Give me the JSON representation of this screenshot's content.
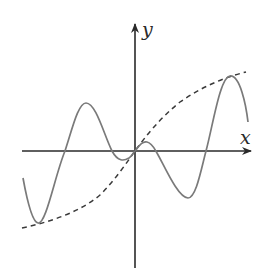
{
  "figure": {
    "type": "function-graph",
    "axes": {
      "x_label": "x",
      "y_label": "y",
      "origin_px": [
        135,
        151
      ],
      "x_axis_px": {
        "from": 22,
        "to": 251
      },
      "y_axis_px": {
        "from": 268,
        "to": 24
      },
      "ticks": "none"
    },
    "colors": {
      "axes": "#2a2a2a",
      "solid_curve": "#7a7a7a",
      "dashed_curve": "#3a3a3a",
      "background": "#ffffff"
    },
    "curves": [
      {
        "name": "oscillating-function",
        "style": "solid",
        "path": "M23,178 C27,200 32,222 38,223 C46,225 55,175 65,151 C72,130 78,103 86,103 C96,103 104,135 112,151 C118,162 124,161 129,158 C132,156 133,153 135,151 C139,146 142,141 147,142 C152,143 154,148 157,153 C164,165 178,198 188,198 C196,198 201,170 206,151 C213,125 220,77 230,76 C240,75 246,105 248,122",
        "key_points_px": {
          "local_min_left": [
            38,
            223
          ],
          "local_max_left": [
            86,
            103
          ],
          "small_dip": [
            129,
            158
          ],
          "origin": [
            135,
            151
          ],
          "small_bump": [
            147,
            142
          ],
          "local_min_right": [
            188,
            198
          ],
          "local_max_right": [
            230,
            76
          ]
        }
      },
      {
        "name": "envelope-curve",
        "style": "dashed",
        "path": "M22,228 C50,222 80,212 100,195 C115,180 125,165 135,151 C145,137 160,118 180,102 C200,88 222,78 246,72"
      }
    ]
  }
}
